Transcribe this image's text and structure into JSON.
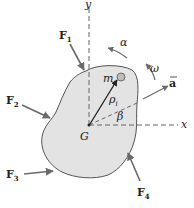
{
  "diagram": {
    "type": "rigid-body-free-body-diagram",
    "axes": {
      "x_label": "x",
      "y_label": "y"
    },
    "center_of_mass_label": "G",
    "particle": {
      "label": "m",
      "subscript": "i"
    },
    "position_vector": {
      "label": "ρ",
      "subscript": "i"
    },
    "angle_label": "β",
    "angular_acceleration_label": "α",
    "angular_velocity_label": "ω",
    "acceleration_label": "a",
    "forces": [
      {
        "label": "F",
        "subscript": "1"
      },
      {
        "label": "F",
        "subscript": "2"
      },
      {
        "label": "F",
        "subscript": "3"
      },
      {
        "label": "F",
        "subscript": "4"
      }
    ],
    "colors": {
      "body_fill": "#e3e3e3",
      "body_stroke": "#555555",
      "arrow": "#6a6a6a",
      "axis_dash": "#666666",
      "text": "#222222",
      "particle_fill": "#bdbdbd"
    }
  }
}
